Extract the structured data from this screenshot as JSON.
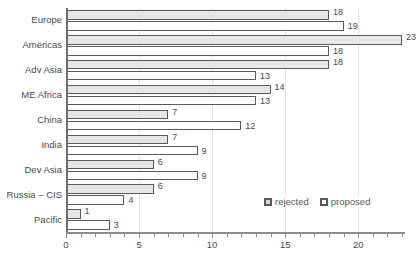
{
  "chart_data": {
    "type": "bar",
    "orientation": "horizontal",
    "title": "",
    "subtitle": "",
    "xlabel": "",
    "ylabel": "",
    "xlim": [
      0,
      23.2
    ],
    "grid": true,
    "gridlines_at": [
      5,
      10,
      15,
      20
    ],
    "legend_position": "inside-bottom-right",
    "xticks": [
      "0",
      "5",
      "10",
      "15",
      "20"
    ],
    "xtick_values": [
      0,
      5,
      10,
      15,
      20
    ],
    "xtick_minor_step": 1,
    "categories": [
      "Europe",
      "Americas",
      "Adv Asia",
      "ME Africa",
      "China",
      "India",
      "Dev Asia",
      "Russia – CIS",
      "Pacific"
    ],
    "series": [
      {
        "name": "rejected",
        "color": "#e6e6e6",
        "border": "#595959",
        "values": [
          18,
          23,
          18,
          14,
          7,
          7,
          6,
          6,
          1
        ],
        "labels": [
          "18",
          "23",
          "18",
          "14",
          "7",
          "7",
          "6",
          "6",
          "1"
        ]
      },
      {
        "name": "proposed",
        "color": "#ffffff",
        "border": "#595959",
        "values": [
          19,
          18,
          13,
          13,
          12,
          9,
          9,
          4,
          3
        ],
        "labels": [
          "19",
          "18",
          "13",
          "13",
          "12",
          "9",
          "9",
          "4",
          "3"
        ]
      }
    ]
  },
  "legend": {
    "items": [
      {
        "label": "rejected",
        "swatch": "rejected"
      },
      {
        "label": "proposed",
        "swatch": "proposed"
      }
    ]
  },
  "colors": {
    "rejected_fill": "#e6e6e6",
    "proposed_fill": "#ffffff",
    "bar_border": "#595959",
    "axis": "#8a8a8a",
    "gridline": "#e3e3e3",
    "text": "#4a4a4a",
    "background": "#ffffff"
  }
}
